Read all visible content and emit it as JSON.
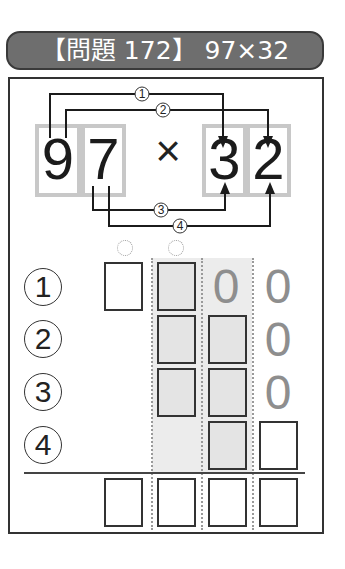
{
  "header": {
    "title": "【問題 172】 97×32",
    "problem_label": "問題",
    "problem_number": "172",
    "expression": "97×32"
  },
  "problem": {
    "multiplicand_digits": [
      "9",
      "7"
    ],
    "operator": "×",
    "multiplier_digits": [
      "3",
      "2"
    ]
  },
  "steps": [
    {
      "label": "①",
      "from": "9",
      "to": "3"
    },
    {
      "label": "②",
      "from": "9",
      "to": "2"
    },
    {
      "label": "③",
      "from": "7",
      "to": "3"
    },
    {
      "label": "④",
      "from": "7",
      "to": "2"
    }
  ],
  "grid": {
    "row_labels": [
      "①",
      "②",
      "③",
      "④"
    ],
    "row1": {
      "zeros": [
        "0",
        "0"
      ]
    },
    "row2": {
      "zeros": [
        "0"
      ]
    },
    "row3": {
      "zeros": [
        "0"
      ]
    }
  },
  "colors": {
    "header_bg": "#6e6e6e",
    "digit_box_border": "#c8c8c8",
    "shade": "#ececec",
    "zero_text": "#8e8e8e"
  }
}
